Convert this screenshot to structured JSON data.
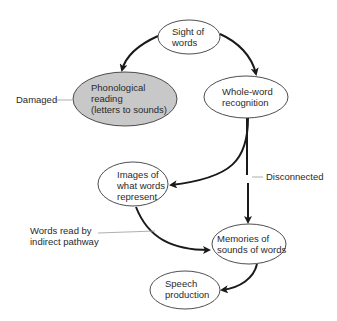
{
  "colors": {
    "node_fill": "#ffffff",
    "damaged_fill": "#c8c8c8",
    "stroke": "#3a3a3a",
    "arrow": "#1a1a1a",
    "leader": "#9a9a9a"
  },
  "nodes": {
    "sight": {
      "lines": [
        "Sight of",
        "words"
      ]
    },
    "phonological": {
      "lines": [
        "Phonological",
        "reading",
        "(letters to sounds)"
      ],
      "state": "damaged"
    },
    "whole_word": {
      "lines": [
        "Whole-word",
        "recognition"
      ]
    },
    "images": {
      "lines": [
        "Images of",
        "what words",
        "represent"
      ]
    },
    "memories": {
      "lines": [
        "Memories of",
        "sounds of words"
      ]
    },
    "speech": {
      "lines": [
        "Speech",
        "production"
      ]
    }
  },
  "annotations": {
    "damaged": "Damaged",
    "disconnected": "Disconnected",
    "indirect": [
      "Words read by",
      "indirect pathway"
    ]
  },
  "edges": [
    {
      "from": "sight",
      "to": "phonological"
    },
    {
      "from": "sight",
      "to": "whole_word"
    },
    {
      "from": "whole_word",
      "to": "images"
    },
    {
      "from": "whole_word",
      "to": "memories",
      "state": "disconnected"
    },
    {
      "from": "images",
      "to": "memories"
    },
    {
      "from": "memories",
      "to": "speech"
    }
  ]
}
